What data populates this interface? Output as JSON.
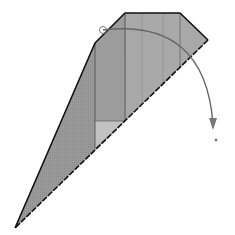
{
  "diagram": {
    "type": "origami-fold-step",
    "colors": {
      "paper_dark": "#8f8f8f",
      "paper_mid": "#a6a6a6",
      "paper_light": "#c4c4c4",
      "outline": "#111111",
      "arrow": "#666666"
    },
    "shapes": {
      "outer_polygon": [
        [
          15,
          228
        ],
        [
          95,
          43
        ],
        [
          125,
          13
        ],
        [
          180,
          13
        ],
        [
          208,
          40
        ]
      ],
      "dashed_edge": [
        [
          208,
          40
        ],
        [
          15,
          228
        ]
      ],
      "vertical_creases_x": [
        125,
        142,
        163,
        180
      ],
      "inner_flap": {
        "x": 95,
        "y": 121,
        "w": 29,
        "h": 26
      },
      "arrow_start": [
        103,
        30
      ],
      "arrow_end": [
        213,
        128
      ],
      "end_dot": [
        216,
        140
      ]
    }
  }
}
